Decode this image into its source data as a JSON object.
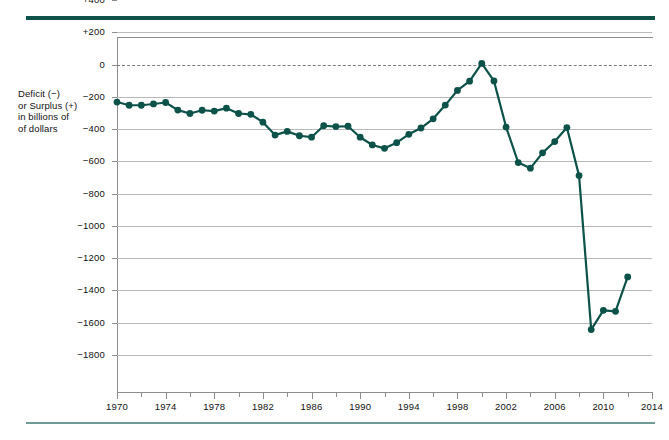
{
  "figure": {
    "y_axis_caption_lines": [
      "Deficit (−)",
      "or Surplus (+)",
      "in billions of",
      "of dollars"
    ],
    "accent_color": "#0d5249",
    "grid_color": "#b9b9b9",
    "zero_line_color": "#7d7d7d"
  },
  "chart_data": {
    "type": "line",
    "title": "",
    "subtitle": "",
    "xlabel": "",
    "ylabel": "Deficit (−) or Surplus (+) in billions of of dollars",
    "xlim": [
      1970,
      2014
    ],
    "ylim": [
      -1800,
      400
    ],
    "ytick_step": 200,
    "xtick_step": 4,
    "xminor_step": 2,
    "grid": true,
    "legend": "none",
    "zero_reference_line": 0,
    "ytick_labels": [
      "+400",
      "+200",
      "0",
      "−200",
      "−400",
      "−600",
      "−800",
      "−1000",
      "−1200",
      "−1400",
      "−1600",
      "−1800"
    ],
    "yticks": [
      400,
      200,
      0,
      -200,
      -400,
      -600,
      -800,
      -1000,
      -1200,
      -1400,
      -1600,
      -1800
    ],
    "xtick_labels": [
      "1970",
      "1974",
      "1978",
      "1982",
      "1986",
      "1990",
      "1994",
      "1998",
      "2002",
      "2006",
      "2010",
      "2014"
    ],
    "xticks": [
      1970,
      1974,
      1978,
      1982,
      1986,
      1990,
      1994,
      1998,
      2002,
      2006,
      2010,
      2014
    ],
    "x": [
      1970,
      1971,
      1972,
      1973,
      1974,
      1975,
      1976,
      1977,
      1978,
      1979,
      1980,
      1981,
      1982,
      1983,
      1984,
      1985,
      1986,
      1987,
      1988,
      1989,
      1990,
      1991,
      1992,
      1993,
      1994,
      1995,
      1996,
      1997,
      1998,
      1999,
      2000,
      2001,
      2002,
      2003,
      2004,
      2005,
      2006,
      2007,
      2008,
      2009,
      2010,
      2011,
      2012
    ],
    "values": [
      -3,
      -23,
      -23,
      -15,
      -6,
      -53,
      -74,
      -54,
      -59,
      -41,
      -74,
      -79,
      -128,
      -208,
      -185,
      -212,
      -221,
      -150,
      -155,
      -153,
      -221,
      -269,
      -290,
      -255,
      -203,
      -164,
      -107,
      -22,
      69,
      126,
      236,
      128,
      -158,
      -378,
      -413,
      -318,
      -248,
      -161,
      -459,
      -1413,
      -1294,
      -1300,
      -1087
    ],
    "series": [
      {
        "name": "Federal budget deficit or surplus",
        "color": "#0d5249",
        "marker": "circle",
        "values": [
          -3,
          -23,
          -23,
          -15,
          -6,
          -53,
          -74,
          -54,
          -59,
          -41,
          -74,
          -79,
          -128,
          -208,
          -185,
          -212,
          -221,
          -150,
          -155,
          -153,
          -221,
          -269,
          -290,
          -255,
          -203,
          -164,
          -107,
          -22,
          69,
          126,
          236,
          128,
          -158,
          -378,
          -413,
          -318,
          -248,
          -161,
          -459,
          -1413,
          -1294,
          -1300,
          -1087
        ]
      }
    ]
  }
}
